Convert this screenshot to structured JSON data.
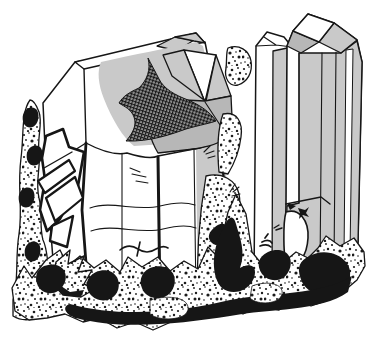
{
  "figure": {
    "kind": "line-art-illustration"
  },
  "palette": {
    "paper": "#ffffff",
    "ink": "#161616",
    "shade": "#c9c9c9",
    "shade-dark": "#b7b7b7",
    "hatch-base": "#8f8f8f",
    "stipple-dot": "#1c1c1c"
  },
  "scene": {
    "elements": [
      "left-rock-ridge",
      "embedded-crystal-fragments",
      "large-blocky-crystal",
      "gray-shading-patch",
      "crosshatched-inclusion",
      "striation-lines",
      "narrow-prism-crystal",
      "tall-prism-crystal",
      "white-rhombic-top-face",
      "broken-termination-notch",
      "lichen-twig-marks",
      "center-rock-column",
      "bottom-rock-matrix"
    ]
  }
}
